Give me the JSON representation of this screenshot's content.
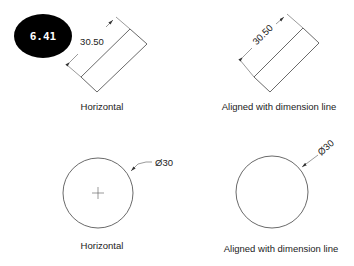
{
  "badge": {
    "label": "6.41",
    "bg_color": "#000000",
    "text_color": "#ffffff"
  },
  "panels": [
    {
      "id": "linear-horizontal",
      "dimension_value": "30.50",
      "text_orientation": "horizontal",
      "caption": "Horizontal"
    },
    {
      "id": "linear-aligned",
      "dimension_value": "30.50",
      "text_orientation": "aligned",
      "caption": "Aligned with dimension line"
    },
    {
      "id": "diameter-horizontal",
      "dimension_value": "Ø30",
      "text_orientation": "horizontal",
      "caption": "Horizontal"
    },
    {
      "id": "diameter-aligned",
      "dimension_value": "Ø30",
      "text_orientation": "aligned",
      "caption": "Aligned with dimension line"
    }
  ],
  "colors": {
    "background": "#ffffff",
    "line": "#444444",
    "text": "#222222"
  }
}
